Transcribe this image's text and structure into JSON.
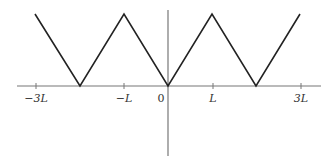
{
  "diagram": {
    "type": "triangle-wave",
    "colors": {
      "background": "#ffffff",
      "axis": "#777777",
      "curve": "#222222",
      "text": "#333333"
    },
    "x_axis": {
      "x_start": 17,
      "x_end": 321,
      "y": 86
    },
    "y_axis": {
      "x": 168,
      "y_start": 10,
      "y_end": 156
    },
    "ticks": [
      {
        "label": "−3L",
        "x": 36,
        "label_x": 36
      },
      {
        "label": "−L",
        "x": 124,
        "label_x": 124
      },
      {
        "label": "L",
        "x": 213,
        "label_x": 213
      },
      {
        "label": "3L",
        "x": 301,
        "label_x": 301
      }
    ],
    "origin": {
      "label": "0",
      "label_x": 161,
      "label_y": 102
    },
    "curve_points": [
      [
        35,
        14
      ],
      [
        80,
        86
      ],
      [
        124,
        14
      ],
      [
        168,
        86
      ],
      [
        212,
        14
      ],
      [
        256,
        86
      ],
      [
        300,
        14
      ]
    ]
  }
}
